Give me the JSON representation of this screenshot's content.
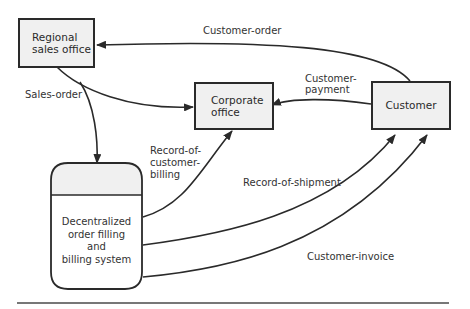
{
  "nodes": {
    "regional": {
      "line1": "Regional",
      "line2": "sales office"
    },
    "corporate": {
      "line1": "Corporate",
      "line2": "office"
    },
    "customer": {
      "label": "Customer"
    },
    "store": {
      "line1": "Decentralized",
      "line2": "order filling",
      "line3": "and",
      "line4": "billing system"
    }
  },
  "flows": {
    "customer_order": "Customer-order",
    "sales_order": "Sales-order",
    "customer_payment_1": "Customer-",
    "customer_payment_2": "payment",
    "record_billing_1": "Record-of-",
    "record_billing_2": "customer-",
    "record_billing_3": "billing",
    "record_shipment": "Record-of-shipment",
    "customer_invoice": "Customer-invoice"
  },
  "colors": {
    "line": "#2a2a2a",
    "box_fill": "#f0f0f0"
  }
}
